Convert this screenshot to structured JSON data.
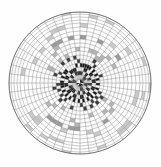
{
  "figure": {
    "title": "",
    "background_color": "#fefefe",
    "width": 161,
    "height": 167
  },
  "chart_data": {
    "type": "heatmap",
    "subtype": "polar-grid-mesh",
    "title": "",
    "subtitle": "",
    "xlabel": "",
    "ylabel": "",
    "legend": [],
    "annotations": [],
    "grid": true,
    "legend_position": "none",
    "geometry": {
      "center_x": 80,
      "center_y": 83,
      "outer_radius": 71,
      "n_radial_spokes": 48,
      "n_rings": 19,
      "ring_outer_radii": [
        4,
        8,
        12,
        16,
        20,
        24,
        28,
        32,
        36,
        40,
        44,
        48,
        52,
        56,
        60,
        63,
        66,
        69,
        71
      ],
      "grid_line_color": "#8c8c8c",
      "grid_line_width": 0.45,
      "outline_color": "#555555",
      "outline_width": 0.7
    },
    "zones": [
      {
        "name": "core-dark-checker",
        "inner_radius": 0,
        "outer_radius": 20,
        "fill_mode": "checkerboard",
        "dark_color": "#141414",
        "light_color": "#f2f2f2",
        "mean_intensity": 0.52
      },
      {
        "name": "inner-transition",
        "inner_radius": 20,
        "outer_radius": 28,
        "fill_mode": "sparse-checker",
        "dark_color": "#3c3c3c",
        "light_color": "#f4f4f4",
        "mean_intensity": 0.3
      },
      {
        "name": "mid-light-band",
        "inner_radius": 28,
        "outer_radius": 46,
        "fill_mode": "faint",
        "dark_color": "#b4b4b4",
        "light_color": "#fbfbfb",
        "mean_intensity": 0.09
      },
      {
        "name": "accent-ring",
        "inner_radius": 46,
        "outer_radius": 50,
        "fill_mode": "faint",
        "dark_color": "#9a9a9a",
        "light_color": "#f6f6f6",
        "mean_intensity": 0.16
      },
      {
        "name": "outer-light-mesh",
        "inner_radius": 50,
        "outer_radius": 71,
        "fill_mode": "faint",
        "dark_color": "#c8c8c8",
        "light_color": "#fdfdfd",
        "mean_intensity": 0.05
      }
    ],
    "radial_intensity_profile": {
      "r_normalized": [
        0.0,
        0.1,
        0.2,
        0.3,
        0.4,
        0.5,
        0.6,
        0.7,
        0.8,
        0.9,
        1.0
      ],
      "mean_cell_darkness": [
        0.55,
        0.54,
        0.5,
        0.33,
        0.14,
        0.09,
        0.1,
        0.16,
        0.08,
        0.05,
        0.04
      ]
    }
  }
}
